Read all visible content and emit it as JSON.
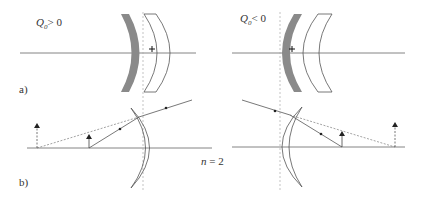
{
  "panels": {
    "a": {
      "label": "a)",
      "left_case": {
        "q_symbol": "Q",
        "q_sub": "0",
        "relation": "> 0"
      },
      "right_case": {
        "q_symbol": "Q",
        "q_sub": "0",
        "relation": "< 0"
      },
      "center_marker": "+"
    },
    "b": {
      "label": "b)",
      "refractive_index": {
        "symbol": "n",
        "value": "= 2"
      }
    }
  },
  "colors": {
    "line": "#555555",
    "mirror_fill": "#8a8a8a",
    "dashed": "#aaaaaa",
    "text": "#333333"
  }
}
